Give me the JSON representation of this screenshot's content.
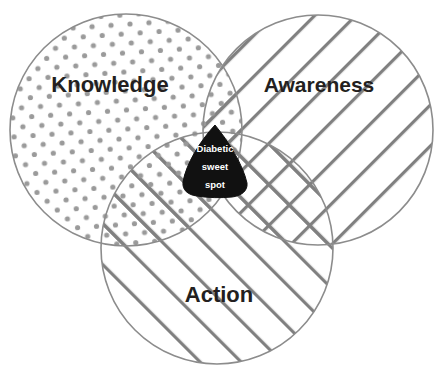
{
  "diagram": {
    "type": "venn-3-set",
    "background_color": "#ffffff",
    "stroke_color": "#808080",
    "dot_color": "#9a9a9a",
    "hatch_color": "#808080",
    "label_color": "#231f20",
    "center_fill": "#111111",
    "center_text_color": "#ffffff"
  },
  "sets": [
    {
      "id": "knowledge",
      "label": "Knowledge",
      "fill_pattern": "dots",
      "label_x": 110,
      "label_y": 92,
      "cx": 126,
      "cy": 130,
      "r": 116
    },
    {
      "id": "awareness",
      "label": "Awareness",
      "fill_pattern": "diagonal-hatch-backslash",
      "label_x": 319,
      "label_y": 92,
      "cx": 318,
      "cy": 130,
      "r": 115
    },
    {
      "id": "action",
      "label": "Action",
      "fill_pattern": "diagonal-hatch-slash",
      "label_x": 219,
      "label_y": 302,
      "cx": 217,
      "cy": 248,
      "r": 116
    }
  ],
  "center": {
    "id": "sweet-spot",
    "lines": [
      "Diabetic",
      "sweet",
      "spot"
    ],
    "line_y": [
      152,
      170,
      188
    ],
    "center_x": 215
  }
}
